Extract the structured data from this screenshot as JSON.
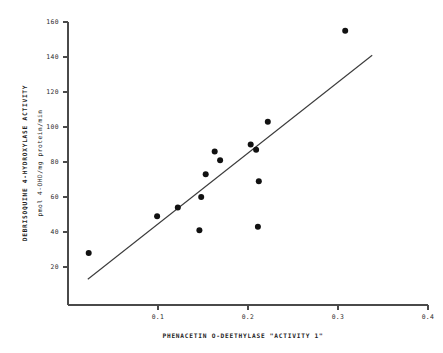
{
  "chart_data": {
    "type": "scatter",
    "title": "",
    "xlabel": "PHENACETIN O-DEETHYLASE \"ACTIVITY 1\"",
    "ylabel": "DEBRISOQUINE 4-HYDROXYLASE ACTIVITY",
    "ylabel2": "pmol 4-OHD/mg protein/min",
    "xlim": [
      0.0,
      0.4
    ],
    "ylim": [
      0,
      160
    ],
    "xticks": [
      0.1,
      0.2,
      0.3,
      0.4
    ],
    "xtick_labels": [
      "0.1",
      "0.2",
      "0.3",
      "0.4"
    ],
    "yticks": [
      20,
      40,
      60,
      80,
      100,
      120,
      140,
      160
    ],
    "ytick_labels": [
      "20",
      "40",
      "60",
      "80",
      "100",
      "120",
      "140",
      "160"
    ],
    "grid": false,
    "legend": "none",
    "points": [
      {
        "x": 0.023,
        "y": 28
      },
      {
        "x": 0.099,
        "y": 49
      },
      {
        "x": 0.122,
        "y": 54
      },
      {
        "x": 0.146,
        "y": 41
      },
      {
        "x": 0.148,
        "y": 60
      },
      {
        "x": 0.153,
        "y": 73
      },
      {
        "x": 0.163,
        "y": 86
      },
      {
        "x": 0.169,
        "y": 81
      },
      {
        "x": 0.203,
        "y": 90
      },
      {
        "x": 0.209,
        "y": 87
      },
      {
        "x": 0.211,
        "y": 43
      },
      {
        "x": 0.212,
        "y": 69
      },
      {
        "x": 0.222,
        "y": 103
      },
      {
        "x": 0.308,
        "y": 155
      }
    ],
    "fit_line": {
      "x_start": 0.022,
      "y_start": 13,
      "x_end": 0.338,
      "y_end": 141
    }
  }
}
